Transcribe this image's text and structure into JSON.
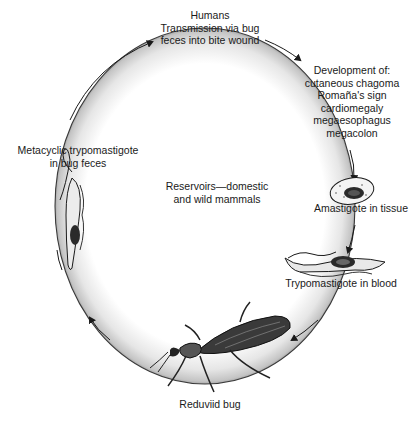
{
  "diagram": {
    "nodes": {
      "humans": {
        "lines": [
          "Humans",
          "Transmission via bug",
          "feces into bite wound"
        ]
      },
      "development": {
        "lines": [
          "Development of:",
          "cutaneous chagoma",
          "Romaña's sign",
          "cardiomegaly",
          "megaesophagus",
          "megacolon"
        ]
      },
      "amastigote": {
        "label": "Amastigote in tissue"
      },
      "trypomastigote": {
        "label": "Trypomastigote in blood"
      },
      "reduviid": {
        "label": "Reduviid bug"
      },
      "metacyclic": {
        "lines": [
          "Metacyclic trypomastigote",
          "in bug feces"
        ]
      },
      "reservoirs": {
        "lines": [
          "Reservoirs—domestic",
          "and wild mammals"
        ]
      }
    },
    "cycle_direction": "clockwise",
    "icons": [
      "amastigote-cell-icon",
      "trypomastigote-icon",
      "metacyclic-trypomastigote-icon",
      "reduviid-bug-icon",
      "cycle-arrow-icon"
    ]
  }
}
